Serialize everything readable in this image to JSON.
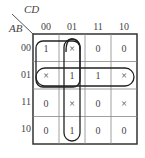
{
  "kmap": {
    "row_var": "AB",
    "col_var": "CD",
    "col_labels": [
      "00",
      "01",
      "11",
      "10"
    ],
    "row_labels": [
      "00",
      "01",
      "11",
      "10"
    ],
    "cells": [
      [
        "1",
        "×",
        "0",
        "0"
      ],
      [
        "×",
        "1",
        "1",
        "×"
      ],
      [
        "0",
        "×",
        "0",
        "×"
      ],
      [
        "0",
        "1",
        "0",
        "0"
      ]
    ],
    "groups": [
      {
        "name": "group-square-ab0x-cd0x",
        "rows": [
          0,
          1
        ],
        "cols": [
          0,
          1
        ]
      },
      {
        "name": "group-column-cd01",
        "rows": [
          0,
          1,
          2,
          3
        ],
        "cols": [
          1
        ]
      },
      {
        "name": "group-row-ab01",
        "rows": [
          1
        ],
        "cols": [
          0,
          1,
          2,
          3
        ]
      }
    ]
  }
}
